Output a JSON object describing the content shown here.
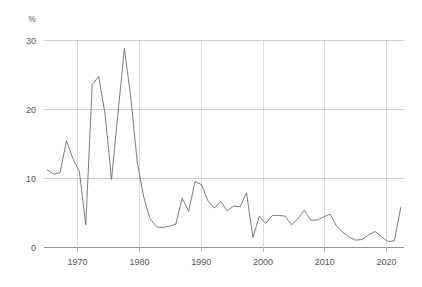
{
  "chart_data": {
    "type": "line",
    "title": "",
    "subtitle": "",
    "xlabel": "",
    "ylabel": "",
    "unit_label": "%",
    "xlim": [
      1966.5,
      2022.5
    ],
    "ylim": [
      0,
      31
    ],
    "grid": "both",
    "legend": "none",
    "yticks": [
      0,
      10,
      20,
      30
    ],
    "ytick_labels": [
      "0",
      "10",
      "20",
      "30"
    ],
    "xticks": [
      1970,
      1980,
      1990,
      2000,
      2010,
      2020
    ],
    "xtick_labels": [
      "1970",
      "1980",
      "1990",
      "2000",
      "2010",
      "2020"
    ],
    "series": [
      {
        "name": "series-1",
        "color": "#6e6e6e",
        "x": [
          1967,
          1968,
          1969,
          1970,
          1971,
          1972,
          1973,
          1974,
          1975,
          1976,
          1977,
          1978,
          1979,
          1980,
          1981,
          1982,
          1983,
          1984,
          1985,
          1986,
          1987,
          1988,
          1989,
          1990,
          1991,
          1992,
          1993,
          1994,
          1995,
          1996,
          1997,
          1998,
          1999,
          2000,
          2001,
          2002,
          2003,
          2004,
          2005,
          2006,
          2007,
          2008,
          2009,
          2010,
          2011,
          2012,
          2013,
          2014,
          2015,
          2016,
          2017,
          2018,
          2019,
          2020,
          2021,
          2022
        ],
        "values": [
          11.6,
          11.0,
          11.2,
          16.0,
          13.3,
          11.4,
          3.4,
          24.4,
          25.6,
          20.0,
          10.2,
          20.0,
          29.8,
          22.5,
          12.8,
          7.6,
          4.3,
          3.1,
          3.0,
          3.2,
          3.5,
          7.4,
          5.4,
          9.9,
          9.4,
          7.0,
          5.9,
          6.9,
          5.5,
          6.2,
          6.1,
          8.2,
          1.5,
          4.7,
          3.6,
          4.8,
          4.8,
          4.7,
          3.4,
          4.3,
          5.6,
          4.1,
          4.1,
          4.6,
          5.0,
          3.2,
          2.3,
          1.5,
          1.1,
          1.2,
          1.9,
          2.4,
          1.6,
          0.9,
          1.0,
          6.0
        ]
      }
    ]
  },
  "axis": {
    "unit": "%"
  }
}
